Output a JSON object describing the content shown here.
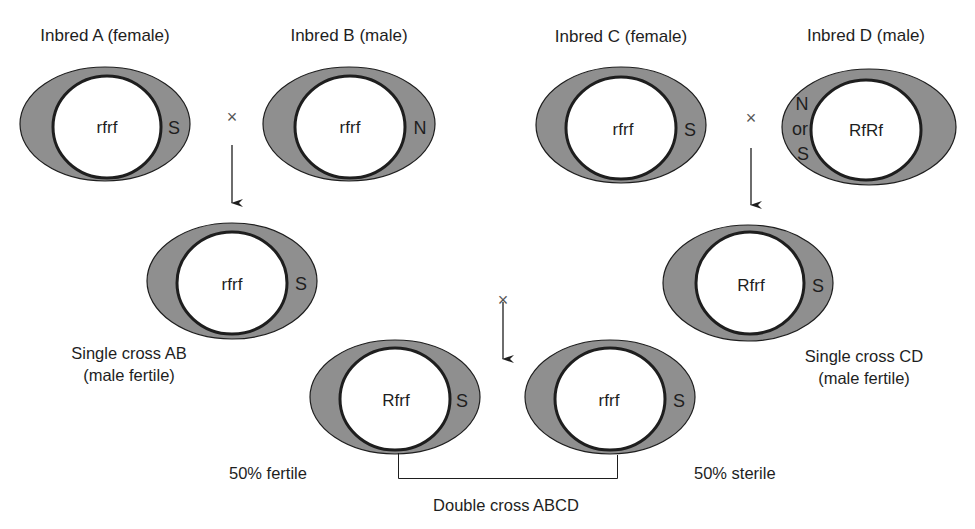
{
  "diagram": {
    "colors": {
      "cytoplasm_fill": "#8f8f8f",
      "outline": "#1e1e1e",
      "nucleus_fill": "#ffffff",
      "text": "#1e1e1e"
    },
    "cross_symbol": "×",
    "parents": [
      {
        "id": "A",
        "label": "Inbred A (female)",
        "genotype": "rfrf",
        "cytoplasm": "S"
      },
      {
        "id": "B",
        "label": "Inbred B (male)",
        "genotype": "rfrf",
        "cytoplasm": "N"
      },
      {
        "id": "C",
        "label": "Inbred C (female)",
        "genotype": "rfrf",
        "cytoplasm": "S"
      },
      {
        "id": "D",
        "label": "Inbred D (male)",
        "genotype": "RfRf",
        "cytoplasm_top": "N",
        "cytoplasm_or": "or",
        "cytoplasm_bottom": "S"
      }
    ],
    "single_crosses": [
      {
        "id": "AB",
        "label_line1": "Single cross AB",
        "label_line2": "(male fertile)",
        "genotype": "rfrf",
        "cytoplasm": "S"
      },
      {
        "id": "CD",
        "label_line1": "Single cross CD",
        "label_line2": "(male fertile)",
        "genotype": "Rfrf",
        "cytoplasm": "S"
      }
    ],
    "double_cross": {
      "label": "Double cross ABCD",
      "progeny": [
        {
          "genotype": "Rfrf",
          "cytoplasm": "S",
          "label": "50% fertile"
        },
        {
          "genotype": "rfrf",
          "cytoplasm": "S",
          "label": "50% sterile"
        }
      ]
    }
  }
}
